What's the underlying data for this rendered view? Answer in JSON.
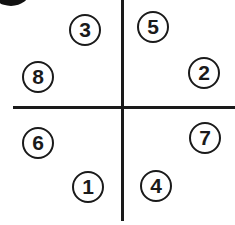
{
  "diagram": {
    "circles": [
      {
        "label": "3",
        "quadrant": "top-left",
        "x": 69,
        "y": 14
      },
      {
        "label": "5",
        "quadrant": "top-right",
        "x": 137,
        "y": 11
      },
      {
        "label": "8",
        "quadrant": "top-left",
        "x": 22,
        "y": 61
      },
      {
        "label": "2",
        "quadrant": "top-right",
        "x": 188,
        "y": 57
      },
      {
        "label": "6",
        "quadrant": "bottom-left",
        "x": 22,
        "y": 127
      },
      {
        "label": "7",
        "quadrant": "bottom-right",
        "x": 189,
        "y": 122
      },
      {
        "label": "1",
        "quadrant": "bottom-left",
        "x": 72,
        "y": 171
      },
      {
        "label": "4",
        "quadrant": "bottom-right",
        "x": 140,
        "y": 170
      }
    ]
  }
}
